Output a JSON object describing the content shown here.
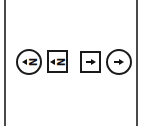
{
  "diagram": {
    "frame": {
      "line_color": "#4a4a4a"
    },
    "symbols": [
      {
        "shape": "circle",
        "arrow": "left",
        "glyph": "N",
        "icon": "circle-left-arrow-n-icon"
      },
      {
        "shape": "square",
        "arrow": "left",
        "glyph": "N",
        "icon": "square-left-arrow-n-icon"
      },
      {
        "shape": "square",
        "arrow": "right",
        "glyph": "",
        "icon": "square-dash-right-arrow-icon"
      },
      {
        "shape": "circle",
        "arrow": "right",
        "glyph": "",
        "icon": "circle-dash-right-arrow-icon"
      }
    ],
    "stroke_color": "#1a1a1a"
  }
}
